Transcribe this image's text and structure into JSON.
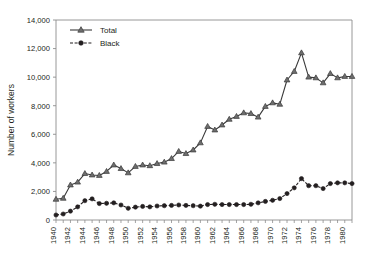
{
  "chart_data": {
    "type": "line",
    "title": "",
    "xlabel": "",
    "ylabel": "Number of workers",
    "xlim": [
      1940,
      1981
    ],
    "ylim": [
      0,
      14000
    ],
    "ytick_step": 2000,
    "xtick_step": 1,
    "xlabel_step": 2,
    "grid": false,
    "legend_position": "top-left",
    "ytick_labels": [
      "0",
      "2,000",
      "4,000",
      "6,000",
      "8,000",
      "10,000",
      "12,000",
      "14,000"
    ],
    "ytick_values": [
      0,
      2000,
      4000,
      6000,
      8000,
      10000,
      12000,
      14000
    ],
    "xtick_labels": [
      "1940",
      "1942",
      "1944",
      "1946",
      "1948",
      "1950",
      "1952",
      "1954",
      "1956",
      "1958",
      "1960",
      "1962",
      "1964",
      "1966",
      "1968",
      "1970",
      "1972",
      "1974",
      "1976",
      "1978",
      "1980"
    ],
    "xtick_values": [
      1940,
      1942,
      1944,
      1946,
      1948,
      1950,
      1952,
      1954,
      1956,
      1958,
      1960,
      1962,
      1964,
      1966,
      1968,
      1970,
      1972,
      1974,
      1976,
      1978,
      1980
    ],
    "x": [
      1940,
      1941,
      1942,
      1943,
      1944,
      1945,
      1946,
      1947,
      1948,
      1949,
      1950,
      1951,
      1952,
      1953,
      1954,
      1955,
      1956,
      1957,
      1958,
      1959,
      1960,
      1961,
      1962,
      1963,
      1964,
      1965,
      1966,
      1967,
      1968,
      1969,
      1970,
      1971,
      1972,
      1973,
      1974,
      1975,
      1976,
      1977,
      1978,
      1979,
      1980,
      1981
    ],
    "series": [
      {
        "name": "Total",
        "marker": "triangle",
        "line_style": "solid",
        "color": "#6e6e6e",
        "line_color": "#3a3a3a",
        "values": [
          1450,
          1520,
          2450,
          2650,
          3250,
          3150,
          3120,
          3400,
          3850,
          3600,
          3300,
          3750,
          3850,
          3800,
          3950,
          4050,
          4300,
          4800,
          4650,
          4900,
          5400,
          6550,
          6300,
          6650,
          7050,
          7250,
          7500,
          7450,
          7200,
          7950,
          8200,
          8100,
          9800,
          10400,
          11700,
          10000,
          9950,
          9600,
          10250,
          9950,
          10050,
          10050
        ]
      },
      {
        "name": "Black",
        "marker": "circle",
        "line_style": "dashed",
        "color": "#231f20",
        "line_color": "#231f20",
        "values": [
          350,
          420,
          620,
          920,
          1350,
          1480,
          1150,
          1170,
          1200,
          1050,
          820,
          900,
          950,
          920,
          980,
          1000,
          1020,
          1050,
          1020,
          1000,
          970,
          1080,
          1100,
          1080,
          1080,
          1080,
          1080,
          1100,
          1200,
          1300,
          1380,
          1500,
          1850,
          2250,
          2900,
          2400,
          2400,
          2200,
          2550,
          2600,
          2600,
          2550
        ]
      }
    ]
  },
  "legend": {
    "entries": [
      {
        "label": "Total"
      },
      {
        "label": "Black"
      }
    ]
  },
  "axes": {
    "y_title": "Number of workers"
  }
}
